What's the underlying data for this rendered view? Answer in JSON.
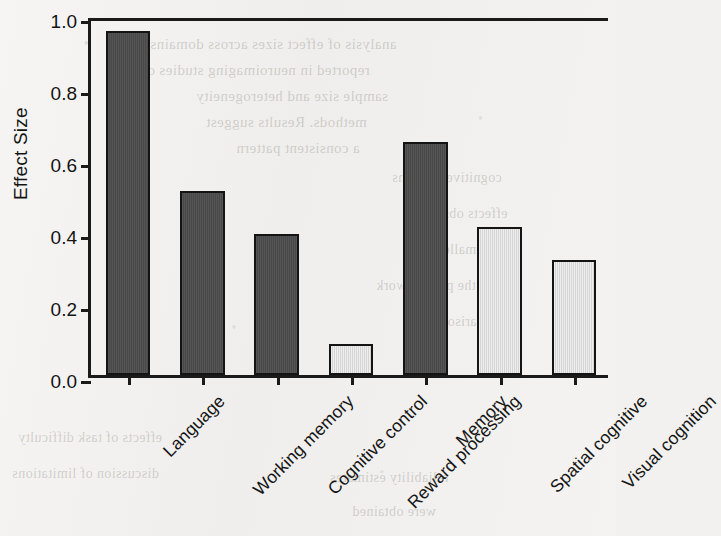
{
  "chart_data": {
    "type": "bar",
    "title": "",
    "xlabel": "",
    "ylabel": "Effect Size",
    "ylim": [
      0.0,
      1.0
    ],
    "ytick_labels": [
      "0.0",
      "0.2",
      "0.4",
      "0.6",
      "0.8",
      "1.0"
    ],
    "ytick_values": [
      0.0,
      0.2,
      0.4,
      0.6,
      0.8,
      1.0
    ],
    "grid": false,
    "legend": "none",
    "categories": [
      "Language",
      "Working memory",
      "Cognitive control",
      "Reward processing",
      "Memory",
      "Spatial cognitive",
      "Visual cognition"
    ],
    "values": [
      0.955,
      0.512,
      0.393,
      0.086,
      0.647,
      0.412,
      0.319
    ],
    "bar_shades": [
      "dark",
      "dark",
      "dark",
      "light",
      "dark",
      "light",
      "light"
    ],
    "colors": {
      "dark_bar": "#4c4c4c",
      "light_bar": "#dcdcdc",
      "bar_edge": "#141414",
      "axis": "#1a1a1a",
      "background": "#f3f2f0",
      "text": "#141414"
    }
  },
  "background_bleed": [
    {
      "text": "analysis of effect sizes across domains",
      "x": 150,
      "y": 36,
      "size": 15
    },
    {
      "text": "reported in neuroimaging studies of the",
      "x": 118,
      "y": 62,
      "size": 15
    },
    {
      "text": "sample size and heterogeneity",
      "x": 196,
      "y": 88,
      "size": 15
    },
    {
      "text": "methods. Results suggest",
      "x": 206,
      "y": 114,
      "size": 15
    },
    {
      "text": "a consistent pattern",
      "x": 236,
      "y": 140,
      "size": 15
    },
    {
      "text": "cognitive domains",
      "x": 392,
      "y": 170,
      "size": 14
    },
    {
      "text": "effects observed",
      "x": 410,
      "y": 206,
      "size": 14
    },
    {
      "text": "were smaller",
      "x": 438,
      "y": 242,
      "size": 14
    },
    {
      "text": "in the present work",
      "x": 376,
      "y": 278,
      "size": 14
    },
    {
      "text": "comparison",
      "x": 440,
      "y": 314,
      "size": 14
    },
    {
      "text": "effects of task difficulty",
      "x": 18,
      "y": 430,
      "size": 14
    },
    {
      "text": "discussion of limitations",
      "x": 12,
      "y": 466,
      "size": 14
    },
    {
      "text": "reliability estimates",
      "x": 330,
      "y": 470,
      "size": 14
    },
    {
      "text": "were obtained",
      "x": 352,
      "y": 504,
      "size": 14
    }
  ]
}
